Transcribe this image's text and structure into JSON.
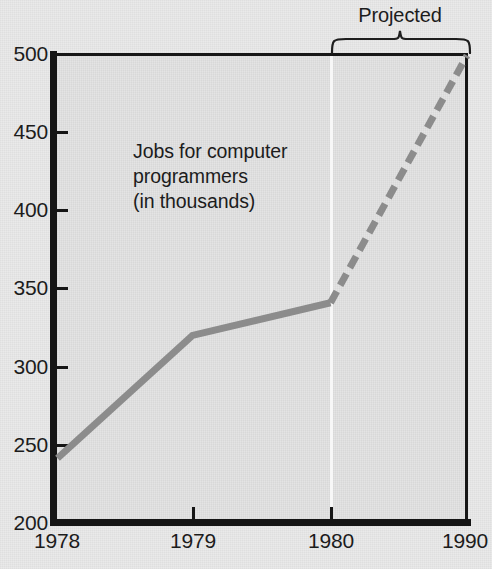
{
  "chart_data": {
    "type": "line",
    "title": "Jobs for computer programmers (in thousands)",
    "xlabel": "",
    "ylabel": "",
    "xlim": [
      1978,
      1990
    ],
    "ylim": [
      200,
      500
    ],
    "ytick_labels": [
      "500",
      "450",
      "400",
      "350",
      "300",
      "250",
      "200"
    ],
    "ytick_values": [
      500,
      450,
      400,
      350,
      300,
      250,
      200
    ],
    "xtick_labels": [
      "1978",
      "1979",
      "1980",
      "1990"
    ],
    "xtick_values": [
      1978,
      1979,
      1980,
      1990
    ],
    "grid": false,
    "legend": "none",
    "series": [
      {
        "name": "Actual",
        "style": "solid",
        "color": "#8c8c8c",
        "x": [
          1978,
          1979,
          1980
        ],
        "values": [
          241,
          320,
          341
        ]
      },
      {
        "name": "Projected",
        "style": "dashed",
        "color": "#8c8c8c",
        "x": [
          1980,
          1990
        ],
        "values": [
          341,
          500
        ]
      }
    ],
    "annotations": [
      {
        "name": "series-caption",
        "lines": [
          "Jobs for computer",
          "programmers",
          "(in thousands)"
        ]
      },
      {
        "name": "projected-bracket",
        "label": "Projected",
        "span": [
          1980,
          1990
        ]
      }
    ]
  },
  "annotation": {
    "line1": "Jobs for computer",
    "line2": "programmers",
    "line3": "(in thousands)"
  },
  "projected": {
    "label": "Projected"
  },
  "colors": {
    "series_line": "#8c8c8c",
    "axis": "#151515",
    "plot_background": "#e4e4e4",
    "page_background": "#eaeaea",
    "divider": "#f7f7f7",
    "text": "#1c1c1c"
  }
}
